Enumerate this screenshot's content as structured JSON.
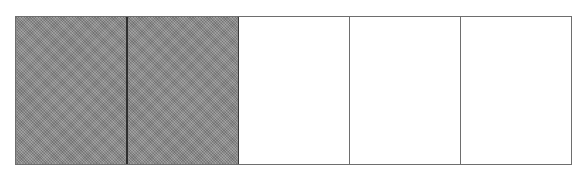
{
  "diagram": {
    "type": "fraction-bar",
    "total_parts": 5,
    "shaded_parts": 2,
    "colors": {
      "shaded": "#8c8c8c",
      "unshaded": "#ffffff",
      "border": "#6e6e6e"
    },
    "parts": [
      {
        "index": 1,
        "shaded": true
      },
      {
        "index": 2,
        "shaded": true
      },
      {
        "index": 3,
        "shaded": false
      },
      {
        "index": 4,
        "shaded": false
      },
      {
        "index": 5,
        "shaded": false
      }
    ]
  }
}
